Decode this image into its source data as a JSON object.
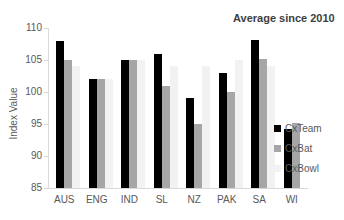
{
  "chart_data": {
    "type": "bar",
    "title": "Average since 2010",
    "xlabel": "",
    "ylabel": "Index Value",
    "ylim": [
      85,
      110
    ],
    "yticks": [
      85,
      90,
      95,
      100,
      105,
      110
    ],
    "grid": false,
    "legend_position": "right",
    "categories": [
      "AUS",
      "ENG",
      "IND",
      "SL",
      "NZ",
      "PAK",
      "SA",
      "WI"
    ],
    "series": [
      {
        "name": "CxTeam",
        "color": "#000000",
        "values": [
          108,
          102,
          105,
          106,
          99,
          103,
          108.2,
          94.2
        ]
      },
      {
        "name": "CxBat",
        "color": "#a6a6a6",
        "values": [
          105,
          102,
          105,
          101,
          95,
          100,
          105.2,
          95.2
        ]
      },
      {
        "name": "CxBowl",
        "color": "#f2f2f2",
        "values": [
          104,
          102,
          105,
          104,
          104,
          105,
          104,
          85
        ]
      }
    ]
  }
}
